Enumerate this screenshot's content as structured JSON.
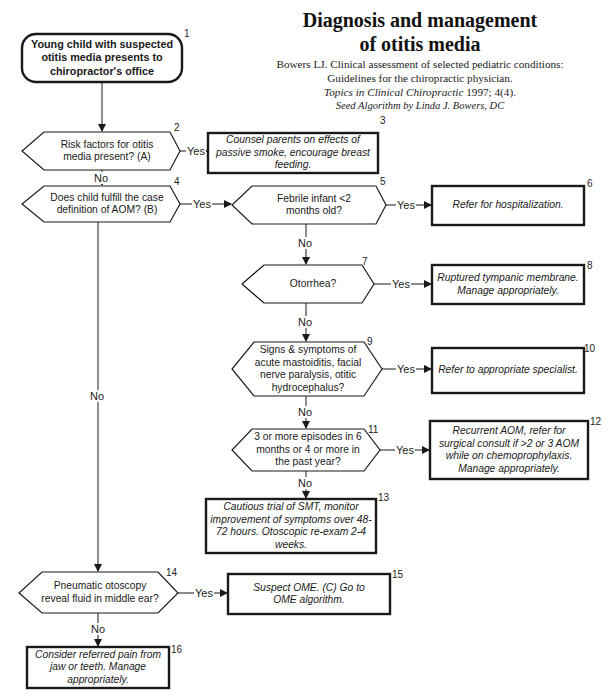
{
  "header": {
    "title_line1": "Diagnosis and management",
    "title_line2": "of otitis media",
    "citation_line1": "Bowers LJ. Clinical assessment of selected pediatric conditions:",
    "citation_line2": "Guidelines for the chiropractic physician.",
    "citation_journal": "Topics in Clinical Chiropractic",
    "citation_details": " 1997; 4(4).",
    "seed_credit": "Seed Algorithm by Linda J. Bowers, DC"
  },
  "nodes": {
    "n1": {
      "number": "1",
      "type": "start",
      "text": "Young child with suspected otitis media presents to chiropractor's office"
    },
    "n2": {
      "number": "2",
      "type": "decision",
      "text": "Risk factors for otitis media present? (A)"
    },
    "n3": {
      "number": "3",
      "type": "action",
      "text": "Counsel parents on effects of passive smoke, encourage breast feeding."
    },
    "n4": {
      "number": "4",
      "type": "decision",
      "text": "Does child fulfill the case definition of AOM? (B)"
    },
    "n5": {
      "number": "5",
      "type": "decision",
      "text": "Febrile infant <2 months old?"
    },
    "n6": {
      "number": "6",
      "type": "action",
      "text": "Refer for hospitalization."
    },
    "n7": {
      "number": "7",
      "type": "decision",
      "text": "Otorrhea?"
    },
    "n8": {
      "number": "8",
      "type": "action",
      "text": "Ruptured tympanic membrane. Manage appropriately."
    },
    "n9": {
      "number": "9",
      "type": "decision",
      "text": "Signs & symptoms of acute mastoiditis, facial nerve paralysis, otitic hydrocephalus?"
    },
    "n10": {
      "number": "10",
      "type": "action",
      "text": "Refer to appropriate  specialist."
    },
    "n11": {
      "number": "11",
      "type": "decision",
      "text": "3 or more episodes in 6 months or 4 or more in the past year?"
    },
    "n12": {
      "number": "12",
      "type": "action",
      "text": "Recurrent AOM, refer for surgical consult if >2 or 3 AOM while on chemoprophylaxis. Manage appropriately."
    },
    "n13": {
      "number": "13",
      "type": "action",
      "text": "Cautious trial of SMT, monitor improvement of symptoms over 48-72 hours. Otoscopic re-exam 2-4 weeks."
    },
    "n14": {
      "number": "14",
      "type": "decision",
      "text": "Pneumatic otoscopy reveal fluid in middle ear?"
    },
    "n15": {
      "number": "15",
      "type": "action",
      "text": "Suspect OME. (C) Go to OME algorithm."
    },
    "n16": {
      "number": "16",
      "type": "action",
      "text": "Consider referred pain from jaw or teeth. Manage appropriately."
    }
  },
  "edges": [
    {
      "from": "n1",
      "to": "n2",
      "label": ""
    },
    {
      "from": "n2",
      "to": "n3",
      "label": "Yes"
    },
    {
      "from": "n2",
      "to": "n4",
      "label": "No"
    },
    {
      "from": "n4",
      "to": "n5",
      "label": "Yes"
    },
    {
      "from": "n4",
      "to": "n14",
      "label": "No"
    },
    {
      "from": "n5",
      "to": "n6",
      "label": "Yes"
    },
    {
      "from": "n5",
      "to": "n7",
      "label": "No"
    },
    {
      "from": "n7",
      "to": "n8",
      "label": "Yes"
    },
    {
      "from": "n7",
      "to": "n9",
      "label": "No"
    },
    {
      "from": "n9",
      "to": "n10",
      "label": "Yes"
    },
    {
      "from": "n9",
      "to": "n11",
      "label": "No"
    },
    {
      "from": "n11",
      "to": "n12",
      "label": "Yes"
    },
    {
      "from": "n11",
      "to": "n13",
      "label": "No"
    },
    {
      "from": "n14",
      "to": "n15",
      "label": "Yes"
    },
    {
      "from": "n14",
      "to": "n16",
      "label": "No"
    }
  ],
  "labels": {
    "yes": "Yes",
    "no": "No"
  },
  "colors": {
    "stroke": "#1a1a1a",
    "background": "#ffffff",
    "text": "#1a1a1a"
  }
}
